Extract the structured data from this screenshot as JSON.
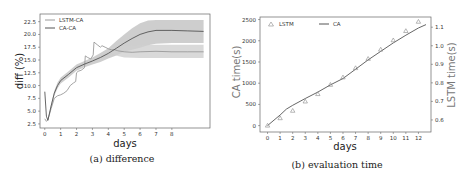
{
  "chart_data": [
    {
      "type": "line",
      "title": "",
      "caption": "(a) difference",
      "xlabel": "days",
      "ylabel": "diff (%)",
      "xlim": [
        -0.3,
        10.4
      ],
      "ylim": [
        1.7,
        24.0
      ],
      "xticks": [
        "0",
        "1",
        "2",
        "3",
        "4",
        "5",
        "6",
        "7",
        "8"
      ],
      "xtick_values": [
        0,
        1,
        2,
        3,
        4,
        5,
        6,
        7,
        8
      ],
      "yticks": [
        "2.5",
        "5.0",
        "7.5",
        "10.0",
        "12.5",
        "15.0",
        "17.5",
        "20.0",
        "22.5"
      ],
      "ytick_values": [
        2.5,
        5.0,
        7.5,
        10.0,
        12.5,
        15.0,
        17.5,
        20.0,
        22.5
      ],
      "legend_position": "top-left",
      "grid": false,
      "series": [
        {
          "name": "LSTM-CA",
          "color": "#9a9a9a",
          "x": [
            0,
            0.1,
            0.2,
            0.4,
            0.6,
            0.8,
            1.0,
            1.2,
            1.4,
            1.6,
            1.8,
            1.95,
            2.0,
            2.1,
            2.3,
            2.5,
            2.55,
            2.7,
            2.9,
            3.05,
            3.1,
            3.3,
            3.5,
            3.6,
            3.8,
            4.0,
            4.2,
            4.4,
            4.6,
            4.8,
            5.0,
            5.5,
            6.0,
            7.0,
            8.0,
            9.0,
            10.0
          ],
          "y": [
            3.5,
            3.0,
            3.3,
            5.5,
            7.5,
            8.0,
            8.2,
            8.5,
            9.0,
            10.0,
            10.5,
            10.8,
            12.5,
            12.8,
            13.0,
            13.5,
            15.8,
            15.5,
            15.2,
            16.0,
            18.5,
            18.0,
            17.5,
            17.8,
            17.5,
            17.2,
            17.0,
            17.0,
            16.8,
            16.7,
            16.6,
            16.5,
            16.6,
            16.7,
            16.6,
            16.6,
            16.6
          ]
        },
        {
          "name": "CA-CA",
          "color": "#555555",
          "x": [
            0,
            0.1,
            0.2,
            0.4,
            0.6,
            0.8,
            1.0,
            1.5,
            2.0,
            2.5,
            3.0,
            3.5,
            4.0,
            4.5,
            5.0,
            5.5,
            6.0,
            6.5,
            7.0,
            8.0,
            9.0,
            10.0
          ],
          "y": [
            8.8,
            4.0,
            3.2,
            6.0,
            8.5,
            10.0,
            11.0,
            12.2,
            13.5,
            14.2,
            14.8,
            15.5,
            16.3,
            17.3,
            18.3,
            19.2,
            20.0,
            20.5,
            20.8,
            20.8,
            20.7,
            20.6
          ],
          "band_low": [
            8.8,
            4.0,
            3.2,
            5.6,
            8.0,
            9.4,
            10.4,
            11.6,
            12.9,
            13.6,
            14.1,
            14.6,
            15.3,
            15.9,
            16.6,
            17.0,
            17.4,
            17.9,
            18.2,
            18.3,
            18.3,
            18.3
          ],
          "band_high": [
            8.8,
            4.0,
            3.2,
            6.4,
            9.0,
            10.6,
            11.6,
            12.8,
            14.1,
            14.8,
            15.5,
            16.4,
            17.3,
            18.7,
            20.0,
            21.2,
            22.2,
            22.7,
            22.8,
            22.8,
            22.8,
            22.8
          ]
        }
      ],
      "lstm_band": {
        "x": [
          4.2,
          4.6,
          5.0,
          6.0,
          7.0,
          8.0,
          9.0,
          10.0
        ],
        "low": [
          16.3,
          15.8,
          15.5,
          15.4,
          15.4,
          15.4,
          15.4,
          15.4
        ],
        "high": [
          17.6,
          17.7,
          17.8,
          17.9,
          18.0,
          18.0,
          18.0,
          18.0
        ]
      }
    },
    {
      "type": "line",
      "title": "",
      "caption": "(b) evaluation time",
      "xlabel": "days",
      "ylabel": "CA time(s)",
      "ylabel_right": "LSTM time(s)",
      "xlim": [
        -0.6,
        13.0
      ],
      "ylim": [
        -150,
        2560
      ],
      "ylim_right": [
        0.535,
        1.155
      ],
      "xticks": [
        "0",
        "1",
        "2",
        "3",
        "4",
        "5",
        "6",
        "7",
        "8",
        "9",
        "10",
        "11",
        "12"
      ],
      "xtick_values": [
        0,
        1,
        2,
        3,
        4,
        5,
        6,
        7,
        8,
        9,
        10,
        11,
        12
      ],
      "yticks": [
        "0",
        "500",
        "1000",
        "1500",
        "2000",
        "2500"
      ],
      "ytick_values": [
        0,
        500,
        1000,
        1500,
        2000,
        2500
      ],
      "yticks_right": [
        "0.6",
        "0.7",
        "0.8",
        "0.9",
        "1.0",
        "1.1"
      ],
      "ytick_values_right": [
        0.6,
        0.7,
        0.8,
        0.9,
        1.0,
        1.1
      ],
      "legend_position": "top",
      "grid": false,
      "series": [
        {
          "name": "LSTM",
          "axis": "right",
          "marker": "triangle",
          "color": "#888888",
          "x": [
            0,
            1,
            2,
            3,
            4,
            5,
            6,
            7,
            8,
            9,
            10,
            11,
            12
          ],
          "y": [
            0.57,
            0.61,
            0.65,
            0.7,
            0.74,
            0.79,
            0.83,
            0.88,
            0.93,
            0.98,
            1.03,
            1.08,
            1.13
          ]
        },
        {
          "name": "CA",
          "axis": "left",
          "marker": "none",
          "color": "#555555",
          "x": [
            0,
            1,
            1.5,
            2,
            3,
            4,
            5,
            6,
            7,
            8,
            9,
            10,
            11,
            12,
            12.6
          ],
          "y": [
            0,
            250,
            390,
            480,
            640,
            790,
            960,
            1110,
            1330,
            1550,
            1750,
            1950,
            2130,
            2300,
            2380
          ]
        }
      ]
    }
  ]
}
